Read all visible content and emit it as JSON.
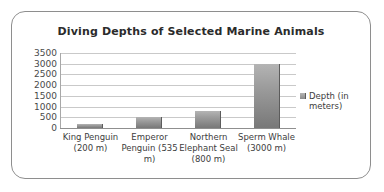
{
  "chart_data": {
    "type": "bar",
    "title": "Diving Depths of Selected Marine Animals",
    "xlabel": "",
    "ylabel": "",
    "ylim": [
      0,
      3500
    ],
    "ytick_step": 500,
    "yticks": [
      3500,
      3000,
      2500,
      2000,
      1500,
      1000,
      500,
      0
    ],
    "ytick_labels": [
      "3500",
      "3000",
      "2500",
      "2000",
      "1500",
      "1000",
      "500",
      "0"
    ],
    "grid": true,
    "legend_position": "right",
    "categories": [
      "King Penguin (200 m)",
      "Emperor Penguin (535 m)",
      "Northern Elephant Seal (800 m)",
      "Sperm Whale (3000 m)"
    ],
    "values": [
      200,
      535,
      800,
      3000
    ],
    "series": [
      {
        "name": "Depth (in meters)",
        "values": [
          200,
          535,
          800,
          3000
        ],
        "color": "#9d9d9d"
      }
    ],
    "legend": [
      "Depth (in meters)"
    ],
    "colors": {
      "bar_top": "#b4b4b4",
      "bar_bottom": "#787878",
      "gridline": "#c9c9c9",
      "axis": "#8f8f8f",
      "title_text": "#2b2b2b",
      "tick_text": "#4a4a4a",
      "border": "#8e8e8e",
      "background": "#ffffff"
    }
  },
  "legend": {
    "label": "Depth (in meters)"
  }
}
